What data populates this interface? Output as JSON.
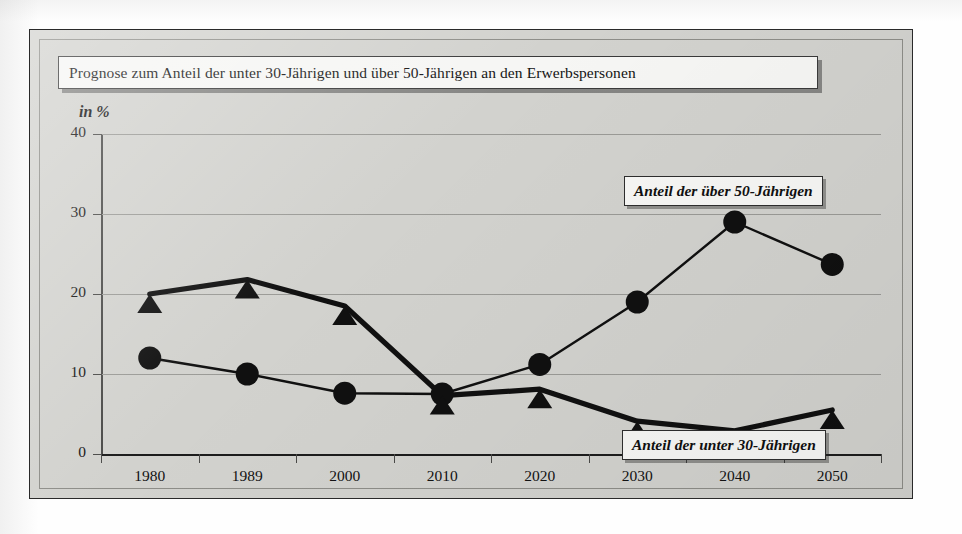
{
  "chart_data": {
    "type": "line",
    "title": "Prognose zum Anteil der unter 30-Jährigen und über 50-Jährigen an den Erwerbspersonen",
    "xlabel": "",
    "ylabel": "in %",
    "unit_label": "in %",
    "categories": [
      "1980",
      "1989",
      "2000",
      "2010",
      "2020",
      "2030",
      "2040",
      "2050"
    ],
    "ylim": [
      0,
      40
    ],
    "yticks": [
      0,
      10,
      20,
      30,
      40
    ],
    "ytick_labels": [
      "0",
      "10",
      "20",
      "30",
      "40"
    ],
    "grid": true,
    "legend_position": "inline-callout",
    "series": [
      {
        "name": "Anteil der über 50-Jährigen",
        "marker": "circle",
        "color": "#101010",
        "values": [
          12,
          10,
          7.6,
          7.5,
          11.2,
          19,
          29,
          23.7
        ]
      },
      {
        "name": "Anteil der unter 30-Jährigen",
        "marker": "triangle",
        "color": "#101010",
        "values": [
          20,
          21.8,
          18.5,
          7.3,
          8.1,
          4.1,
          2.9,
          5.5
        ]
      }
    ],
    "annotations": [
      {
        "text": "Anteil der über 50-Jährigen"
      },
      {
        "text": "Anteil der unter 30-Jährigen"
      }
    ]
  },
  "colors": {
    "panel_background": "#d2d2ce",
    "panel_border": "#2a2a2a",
    "series_ink": "#101010",
    "gridline": "#9a9a96",
    "callout_background": "#f7f7f5"
  }
}
